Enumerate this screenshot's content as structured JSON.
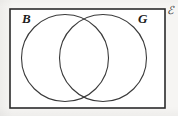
{
  "figure": {
    "type": "venn-diagram",
    "universal_set_label": "ℰ",
    "sets": [
      {
        "id": "B",
        "label": "B",
        "label_x": 22,
        "label_y": 23,
        "cx": 65,
        "cy": 58,
        "r": 43.5
      },
      {
        "id": "G",
        "label": "G",
        "label_x": 138,
        "label_y": 23,
        "cx": 103,
        "cy": 58,
        "r": 43.5
      }
    ],
    "rectangle": {
      "x": 10,
      "y": 9,
      "width": 155,
      "height": 99
    },
    "universal_label_x": 167,
    "universal_label_y": 14,
    "colors": {
      "background": "#f6f5f3",
      "stroke": "#2b2b2b",
      "circle_stroke": "#3a3a3a",
      "label": "#1c1c1c",
      "fill": "#ffffff"
    },
    "stroke_widths": {
      "rectangle": 1.6,
      "circle": 1.1
    },
    "font_sizes": {
      "set_label": 13,
      "universal_label": 11
    }
  }
}
